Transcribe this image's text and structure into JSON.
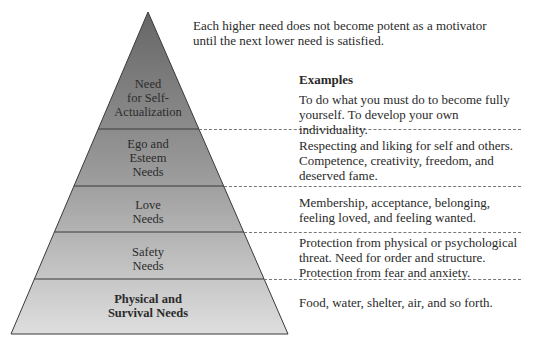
{
  "intro_text_lines": [
    "Each higher need does not become potent as a motivator",
    "until the next lower need is satisfied."
  ],
  "examples_heading": "Examples",
  "colors": {
    "apex": "#6d6d6d",
    "base": "#dcdcdc",
    "outline": "#3a3a3a",
    "dashed": "#777777",
    "text": "#2a2a2a"
  },
  "levels": [
    {
      "name_lines": [
        "Need",
        "for Self-",
        "Actualization"
      ],
      "example_lines": [
        "To do what you must do to become fully",
        "yourself. To develop your own individuality."
      ]
    },
    {
      "name_lines": [
        "Ego and",
        "Esteem",
        "Needs"
      ],
      "example_lines": [
        "Respecting and liking for self and others.",
        "Competence, creativity, freedom, and",
        "deserved fame."
      ]
    },
    {
      "name_lines": [
        "Love",
        "Needs"
      ],
      "example_lines": [
        "Membership, acceptance, belonging,",
        "feeling loved, and feeling wanted."
      ]
    },
    {
      "name_lines": [
        "Safety",
        "Needs"
      ],
      "example_lines": [
        "Protection from physical or psychological",
        "threat. Need for order and structure.",
        "Protection from fear and anxiety."
      ]
    },
    {
      "name_lines": [
        "Physical and",
        "Survival Needs"
      ],
      "example_lines": [
        "Food, water, shelter, air, and so forth."
      ]
    }
  ]
}
